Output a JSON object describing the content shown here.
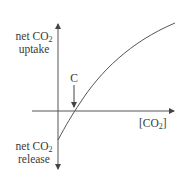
{
  "diagram": {
    "y_axis": {
      "top_label": {
        "line1": "net CO",
        "sub": "2",
        "line2": "uptake"
      },
      "bottom_label": {
        "line1": "net CO",
        "sub": "2",
        "line2": "release"
      }
    },
    "x_axis": {
      "label_prefix": "[CO",
      "label_sub": "2",
      "label_suffix": "]"
    },
    "point_label": "C",
    "colors": {
      "line": "#555555",
      "text": "#3a3a3a"
    }
  }
}
